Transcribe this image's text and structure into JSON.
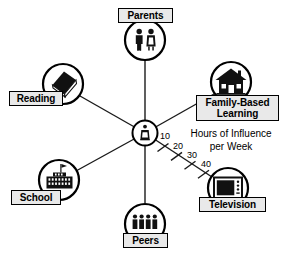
{
  "diagram": {
    "type": "radial-spoke-diagram",
    "center": {
      "name": "child",
      "icon": "child-figure-icon",
      "x": 145,
      "y": 133,
      "radius": 13
    },
    "axis": {
      "title_line1": "Hours of Influence",
      "title_line2": "per Week",
      "unit": "hours per week",
      "ticks": [
        "10",
        "20",
        "30",
        "40"
      ],
      "tick_values": [
        10,
        20,
        30,
        40
      ],
      "on_spoke": "Television"
    },
    "nodes": [
      {
        "label": "Parents",
        "icon": "two-adults-icon",
        "x": 145,
        "y": 40,
        "radius": 21,
        "label_x": 118,
        "label_y": 8,
        "label_w": 55,
        "label_h": 16,
        "angle_deg": 90
      },
      {
        "label": "Reading",
        "icon": "book-icon",
        "x": 63,
        "y": 84,
        "radius": 21,
        "label_x": 9,
        "label_y": 91,
        "label_w": 54,
        "label_h": 16,
        "angle_deg": 152
      },
      {
        "label": "Family-Based\nLearning",
        "icon": "house-icon",
        "x": 231,
        "y": 82,
        "radius": 21,
        "label_x": 196,
        "label_y": 95,
        "label_w": 83,
        "label_h": 27,
        "angle_deg": 28
      },
      {
        "label": "School",
        "icon": "school-building-icon",
        "x": 59,
        "y": 180,
        "radius": 21,
        "label_x": 11,
        "label_y": 190,
        "label_w": 50,
        "label_h": 16,
        "angle_deg": 210
      },
      {
        "label": "Television",
        "icon": "tv-icon",
        "x": 228,
        "y": 188,
        "radius": 21,
        "label_x": 199,
        "label_y": 197,
        "label_w": 67,
        "label_h": 16,
        "angle_deg": 335
      },
      {
        "label": "Peers",
        "icon": "four-people-icon",
        "x": 145,
        "y": 224,
        "radius": 21,
        "label_x": 123,
        "label_y": 233,
        "label_w": 45,
        "label_h": 16,
        "angle_deg": 270
      }
    ]
  },
  "colors": {
    "stroke": "#000000",
    "label_fill": "#e9e9e9",
    "background": "#ffffff"
  }
}
